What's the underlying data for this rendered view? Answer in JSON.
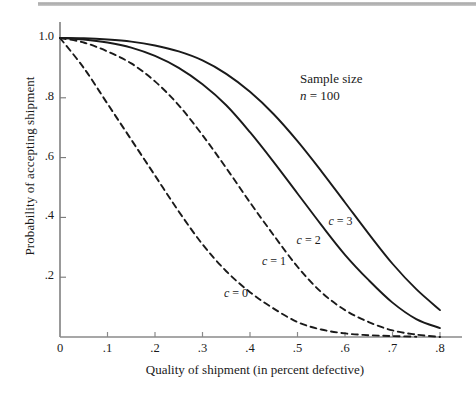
{
  "figure": {
    "title": "",
    "annotation": {
      "line1": "Sample size",
      "line2_var": "n",
      "line2_rest": " = 100"
    }
  },
  "chart_data": {
    "type": "line",
    "title": "",
    "subtitle": "",
    "xlabel": "Quality of shipment (in percent defective)",
    "ylabel": "Probability of accepting shipment",
    "xlim": [
      0,
      0.82
    ],
    "ylim": [
      0,
      1.04
    ],
    "grid": false,
    "legend_position": "inline-curve-labels",
    "annotations": [
      "Sample size",
      "n = 100"
    ],
    "xticks": [
      0,
      0.1,
      0.2,
      0.3,
      0.4,
      0.5,
      0.6,
      0.7,
      0.8
    ],
    "xticklabels": [
      "0",
      ".1",
      ".2",
      ".3",
      ".4",
      ".5",
      ".6",
      ".7",
      ".8"
    ],
    "yticks": [
      0.2,
      0.4,
      0.6,
      0.8,
      1.0
    ],
    "yticklabels": [
      ".2",
      ".4",
      ".6",
      ".8",
      "1.0"
    ],
    "x": [
      0,
      0.05,
      0.1,
      0.15,
      0.2,
      0.25,
      0.3,
      0.35,
      0.4,
      0.45,
      0.5,
      0.55,
      0.6,
      0.65,
      0.7,
      0.75,
      0.8
    ],
    "series": [
      {
        "name": "c = 0",
        "label": "c = 0",
        "style": "dashed",
        "color": "#1a1a1a",
        "label_x": 0.345,
        "label_y": 0.145,
        "values": [
          1.0,
          0.9,
          0.78,
          0.66,
          0.54,
          0.42,
          0.31,
          0.22,
          0.15,
          0.095,
          0.05,
          0.025,
          0.012,
          0.006,
          0.003,
          0.001,
          0.0
        ]
      },
      {
        "name": "c = 1",
        "label": "c = 1",
        "style": "dashed",
        "color": "#1a1a1a",
        "label_x": 0.425,
        "label_y": 0.25,
        "values": [
          1.0,
          0.985,
          0.955,
          0.915,
          0.855,
          0.775,
          0.675,
          0.565,
          0.45,
          0.34,
          0.235,
          0.15,
          0.09,
          0.05,
          0.022,
          0.008,
          0.0
        ]
      },
      {
        "name": "c = 2",
        "label": "c = 2",
        "style": "solid",
        "color": "#1a1a1a",
        "label_x": 0.498,
        "label_y": 0.32,
        "values": [
          1.0,
          0.995,
          0.985,
          0.968,
          0.94,
          0.9,
          0.845,
          0.775,
          0.685,
          0.585,
          0.48,
          0.375,
          0.275,
          0.19,
          0.115,
          0.06,
          0.03
        ]
      },
      {
        "name": "c = 3",
        "label": "c = 3",
        "style": "solid",
        "color": "#1a1a1a",
        "label_x": 0.565,
        "label_y": 0.385,
        "values": [
          1.0,
          0.999,
          0.995,
          0.988,
          0.975,
          0.955,
          0.925,
          0.88,
          0.82,
          0.745,
          0.655,
          0.555,
          0.45,
          0.345,
          0.245,
          0.16,
          0.09
        ]
      }
    ]
  }
}
